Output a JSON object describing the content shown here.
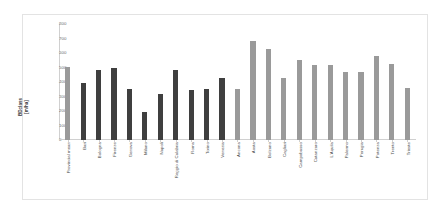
{
  "chart_data": {
    "type": "bar",
    "title": "",
    "xlabel": "",
    "ylabel": "BDclass [m/ha]",
    "ylabel_lines": [
      "BDclass",
      "[m/ha]"
    ],
    "ylim": [
      0,
      800
    ],
    "ytick_step": 100,
    "yticks": [
      0,
      100,
      200,
      300,
      400,
      500,
      600,
      700,
      800
    ],
    "ytick_labels": [
      "0",
      "100",
      "200",
      "300",
      "400",
      "500",
      "600",
      "700",
      "800"
    ],
    "grid": false,
    "legend": "none",
    "categories": [
      "Provincial mean",
      "Bari",
      "Bologna",
      "Firenze",
      "Genova",
      "Milano",
      "Napoli",
      "Reggio di Calabria",
      "Roma",
      "Torino",
      "Venezia",
      "Ancona",
      "Aosta",
      "Bolzano",
      "Cagliari",
      "Campobasso",
      "Catanzaro",
      "L'Aquila",
      "Palermo",
      "Perugia",
      "Potenza",
      "Trento",
      "Trieste"
    ],
    "values": [
      505,
      390,
      480,
      495,
      350,
      195,
      315,
      480,
      345,
      350,
      425,
      350,
      685,
      630,
      425,
      555,
      520,
      515,
      470,
      470,
      580,
      525,
      360
    ],
    "bar_colors": [
      "#9a9a9a",
      "#3f3f3f",
      "#3f3f3f",
      "#3f3f3f",
      "#3f3f3f",
      "#3f3f3f",
      "#3f3f3f",
      "#3f3f3f",
      "#3f3f3f",
      "#3f3f3f",
      "#3f3f3f",
      "#9a9a9a",
      "#9a9a9a",
      "#9a9a9a",
      "#9a9a9a",
      "#9a9a9a",
      "#9a9a9a",
      "#9a9a9a",
      "#9a9a9a",
      "#9a9a9a",
      "#9a9a9a",
      "#9a9a9a",
      "#9a9a9a"
    ]
  },
  "colors": {
    "bar_dark": "#3f3f3f",
    "bar_light": "#9a9a9a",
    "axis": "#d0d0d0",
    "text": "#4a4a4a",
    "plot_background": "#ffffff",
    "frame_border": "#e3e3e3"
  }
}
